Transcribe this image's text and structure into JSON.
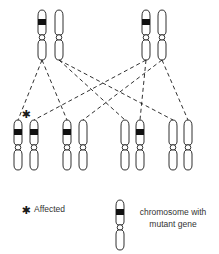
{
  "diagram": {
    "colors": {
      "stroke": "#1a1a1a",
      "band": "#111111",
      "background": "#ffffff"
    },
    "parents": [
      {
        "id": "parent-left",
        "chromosomes": [
          {
            "x": 42,
            "mutant": true
          },
          {
            "x": 59,
            "mutant": false
          }
        ]
      },
      {
        "id": "parent-right",
        "chromosomes": [
          {
            "x": 146,
            "mutant": true
          },
          {
            "x": 162,
            "mutant": false
          }
        ]
      }
    ],
    "offspring": [
      {
        "id": "offspring-1",
        "affected": true,
        "chromosomes": [
          {
            "x": 18,
            "mutant": true
          },
          {
            "x": 34,
            "mutant": true
          }
        ]
      },
      {
        "id": "offspring-2",
        "affected": false,
        "chromosomes": [
          {
            "x": 67,
            "mutant": true
          },
          {
            "x": 83,
            "mutant": false
          }
        ]
      },
      {
        "id": "offspring-3",
        "affected": false,
        "chromosomes": [
          {
            "x": 125,
            "mutant": false
          },
          {
            "x": 140,
            "mutant": true
          }
        ]
      },
      {
        "id": "offspring-4",
        "affected": false,
        "chromosomes": [
          {
            "x": 173,
            "mutant": false
          },
          {
            "x": 188,
            "mutant": false
          }
        ]
      }
    ],
    "affected_marker": "✱"
  },
  "legend": {
    "affected_symbol": "✱",
    "affected_label": "Affected",
    "chromosome_label_line1": "chromosome with",
    "chromosome_label_line2": "mutant gene"
  }
}
